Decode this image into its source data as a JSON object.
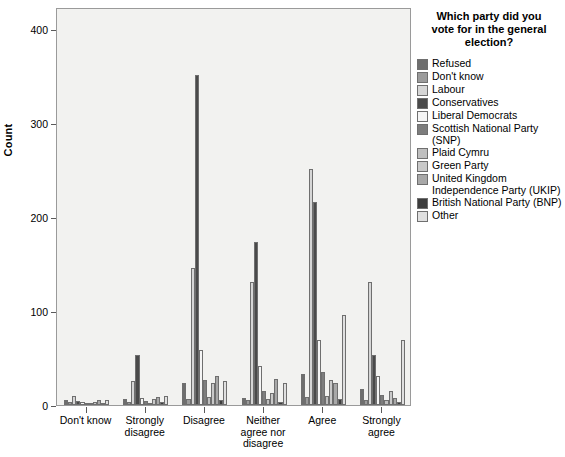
{
  "chart_data": {
    "type": "bar",
    "title": "",
    "xlabel": "",
    "ylabel": "Count",
    "ylim": [
      0,
      420
    ],
    "yticks": [
      0,
      100,
      200,
      300,
      400
    ],
    "ytick_labels": [
      "0",
      "100",
      "200",
      "300",
      "400"
    ],
    "grid": false,
    "legend_position": "right",
    "legend_title": "Which party did you vote for in the general election?",
    "categories": [
      "Don't know",
      "Strongly disagree",
      "Disagree",
      "Neither agree nor disagree",
      "Agree",
      "Strongly agree"
    ],
    "series": [
      {
        "name": "Refused",
        "color": "#6e6e6e",
        "values": [
          4,
          5,
          22,
          6,
          32,
          16
        ]
      },
      {
        "name": "Don't know",
        "color": "#9b9b9b",
        "values": [
          2,
          2,
          5,
          4,
          7,
          4
        ]
      },
      {
        "name": "Labour",
        "color": "#d6d6d6",
        "values": [
          8,
          24,
          145,
          130,
          250,
          130
        ]
      },
      {
        "name": "Conservatives",
        "color": "#4a4a4a",
        "values": [
          3,
          52,
          350,
          172,
          215,
          52
        ]
      },
      {
        "name": "Liberal Democrats",
        "color": "#f5f5f5",
        "values": [
          2,
          6,
          57,
          40,
          68,
          30
        ]
      },
      {
        "name": "Scottish National Party (SNP)",
        "color": "#7d7d7d",
        "values": [
          1,
          3,
          26,
          14,
          34,
          10
        ]
      },
      {
        "name": "Plaid Cymru",
        "color": "#bfbfbf",
        "values": [
          0,
          1,
          7,
          5,
          9,
          4
        ]
      },
      {
        "name": "Green Party",
        "color": "#c9c9c9",
        "values": [
          2,
          5,
          22,
          12,
          26,
          14
        ]
      },
      {
        "name": "United Kingdom Independence Party (UKIP)",
        "color": "#a8a8a8",
        "values": [
          4,
          7,
          30,
          27,
          22,
          6
        ]
      },
      {
        "name": "British National Party (BNP)",
        "color": "#3d3d3d",
        "values": [
          1,
          2,
          4,
          2,
          5,
          2
        ]
      },
      {
        "name": "Other",
        "color": "#e0e0e0",
        "values": [
          4,
          9,
          24,
          22,
          95,
          68
        ]
      }
    ]
  },
  "axis": {
    "y_title": "Count"
  },
  "legend": {
    "title_line1": "Which party did you",
    "title_line2": "vote for in the general",
    "title_line3": "election?",
    "entries": [
      {
        "label": "Refused",
        "label2": ""
      },
      {
        "label": "Don't know",
        "label2": ""
      },
      {
        "label": "Labour",
        "label2": ""
      },
      {
        "label": "Conservatives",
        "label2": ""
      },
      {
        "label": "Liberal Democrats",
        "label2": ""
      },
      {
        "label": "Scottish National Party",
        "label2": "(SNP)"
      },
      {
        "label": "Plaid Cymru",
        "label2": ""
      },
      {
        "label": "Green Party",
        "label2": ""
      },
      {
        "label": "United Kingdom",
        "label2": "Independence Party (UKIP)"
      },
      {
        "label": "British National Party (BNP)",
        "label2": ""
      },
      {
        "label": "Other",
        "label2": ""
      }
    ]
  },
  "colors": {
    "plot_background": "#f2f2f0",
    "plot_border": "#9a9a9a",
    "bar_outline": "#6f6f6f",
    "text": "#000000"
  }
}
